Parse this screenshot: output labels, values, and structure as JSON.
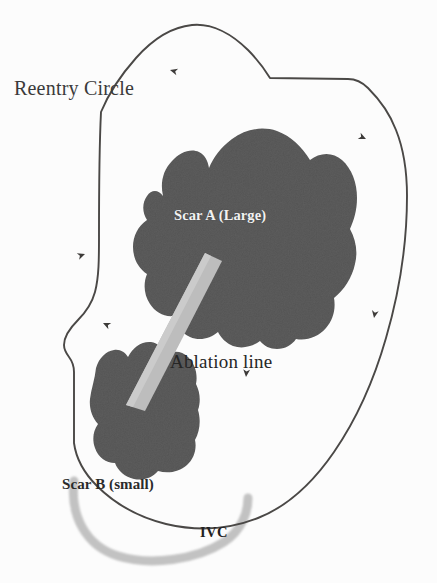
{
  "figure": {
    "width": 437,
    "height": 583,
    "background_color": "#fcfcfc"
  },
  "labels": {
    "reentry_circle": "Reentry Circle",
    "scar_a": "Scar A (Large)",
    "ablation_line": "Ablation line",
    "scar_b": "Scar B (small)",
    "ivc": "IVC"
  },
  "colors": {
    "outline": "#4a4846",
    "scar_fill": "#5c5c5c",
    "scar_fill_dark": "#4f4f4f",
    "ablation_band": "#bdbdbd",
    "ablation_band_edge": "#cccccc",
    "ivc_arc": "#c2c2c2",
    "text_dark": "#2b2b2b",
    "text_light": "#f2f2f2",
    "background": "#fcfcfc"
  },
  "elements": {
    "reentry_outline": {
      "name": "reentry-circle-outline",
      "stroke_width": 1.9,
      "description": "Closed irregular loop representing the right atrial reentry circuit boundary"
    },
    "scar_a": {
      "name": "scar-a-region",
      "size": "large",
      "description": "Large irregular dark scar region occupying the center of the circuit"
    },
    "scar_b": {
      "name": "scar-b-region",
      "size": "small",
      "description": "Smaller dark scar region at lower left of the circuit"
    },
    "ablation_line": {
      "name": "ablation-line-band",
      "description": "Light gray linear lesion band connecting scar A to scar B",
      "angle_degrees": 62
    },
    "ivc": {
      "name": "ivc-arc",
      "description": "Inferior vena cava shown as a thick light gray arc at the bottom",
      "stroke_width": 9
    }
  },
  "flow_arrows": [
    {
      "name": "arrow-top",
      "x": 170,
      "y": 70,
      "rotation": 195,
      "direction": "counterclockwise"
    },
    {
      "name": "arrow-right-upper",
      "x": 366,
      "y": 139,
      "rotation": 25,
      "direction": "clockwise"
    },
    {
      "name": "arrow-right-lower",
      "x": 374,
      "y": 318,
      "rotation": 100,
      "direction": "downward"
    },
    {
      "name": "arrow-left-upper",
      "x": 85,
      "y": 254,
      "rotation": 340,
      "direction": "upward"
    },
    {
      "name": "arrow-left-lower",
      "x": 103,
      "y": 323,
      "rotation": 205,
      "direction": "left"
    },
    {
      "name": "arrow-ablation-pointer",
      "x": 246,
      "y": 377,
      "rotation": 95,
      "direction": "downward"
    }
  ]
}
